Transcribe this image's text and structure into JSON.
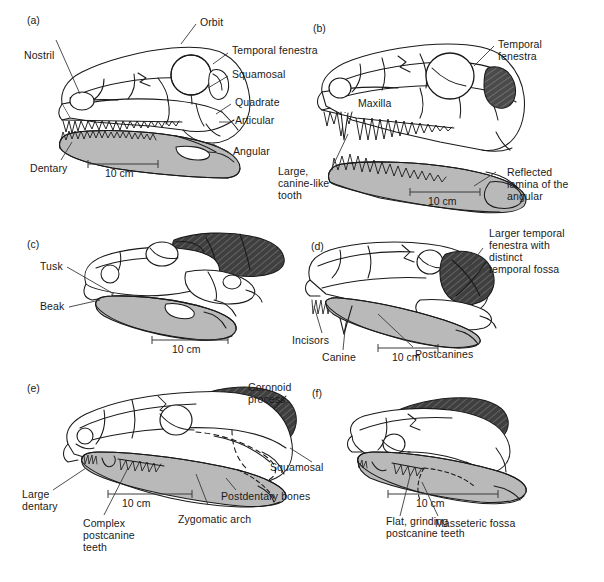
{
  "figure": {
    "type": "scientific-illustration",
    "panel_count": 6,
    "scale_bar_label": "10 cm",
    "colors": {
      "background": "#ffffff",
      "outline": "#1a1a1a",
      "dentary_fill": "#b9b9b9",
      "fenestra_dark_fill": "#4a4a4a",
      "bone_fill": "#ffffff",
      "leader_line": "#3a3a3a"
    }
  },
  "panels": [
    {
      "id": "(a)",
      "scale": "10 cm",
      "labels": [
        {
          "text": "Orbit"
        },
        {
          "text": "Nostril"
        },
        {
          "text": "Temporal fenestra"
        },
        {
          "text": "Squamosal"
        },
        {
          "text": "Quadrate"
        },
        {
          "text": "Articular"
        },
        {
          "text": "Angular"
        },
        {
          "text": "Dentary"
        }
      ]
    },
    {
      "id": "(b)",
      "scale": "10 cm",
      "labels": [
        {
          "text": "Temporal\nfenestra"
        },
        {
          "text": "Maxilla"
        },
        {
          "text": "Large,\ncanine-like\ntooth"
        },
        {
          "text": "Reflected\nlamina of the\nangular"
        }
      ]
    },
    {
      "id": "(c)",
      "scale": "10 cm",
      "labels": [
        {
          "text": "Tusk"
        },
        {
          "text": "Beak"
        }
      ]
    },
    {
      "id": "(d)",
      "scale": "10 cm",
      "labels": [
        {
          "text": "Larger temporal\nfenestra with\ndistinct\ntemporal fossa"
        },
        {
          "text": "Incisors"
        },
        {
          "text": "Canine"
        },
        {
          "text": "Postcanines"
        }
      ]
    },
    {
      "id": "(e)",
      "scale": "10 cm",
      "labels": [
        {
          "text": "Coronoid\nprocess"
        },
        {
          "text": "Squamosal"
        },
        {
          "text": "Postdentary bones"
        },
        {
          "text": "Zygomatic arch"
        },
        {
          "text": "Complex\npostcanine\nteeth"
        },
        {
          "text": "Large\ndentary"
        }
      ]
    },
    {
      "id": "(f)",
      "scale": "10 cm",
      "labels": [
        {
          "text": "Flat, grinding\npostcanine teeth"
        },
        {
          "text": "Masseteric fossa"
        }
      ]
    }
  ],
  "text": {
    "a_id": "(a)",
    "a_orbit": "Orbit",
    "a_nostril": "Nostril",
    "a_temporal_fenestra": "Temporal fenestra",
    "a_squamosal": "Squamosal",
    "a_quadrate": "Quadrate",
    "a_articular": "Articular",
    "a_angular": "Angular",
    "a_dentary": "Dentary",
    "a_scale": "10 cm",
    "b_id": "(b)",
    "b_temporal_fenestra_l1": "Temporal",
    "b_temporal_fenestra_l2": "fenestra",
    "b_maxilla": "Maxilla",
    "b_canine_l1": "Large,",
    "b_canine_l2": "canine-like",
    "b_canine_l3": "tooth",
    "b_reflected_l1": "Reflected",
    "b_reflected_l2": "lamina of the",
    "b_reflected_l3": "angular",
    "b_scale": "10 cm",
    "c_id": "(c)",
    "c_tusk": "Tusk",
    "c_beak": "Beak",
    "c_scale": "10 cm",
    "d_id": "(d)",
    "d_fenestra_l1": "Larger temporal",
    "d_fenestra_l2": "fenestra with",
    "d_fenestra_l3": "distinct",
    "d_fenestra_l4": "temporal fossa",
    "d_incisors": "Incisors",
    "d_canine": "Canine",
    "d_postcanines": "Postcanines",
    "d_scale": "10 cm",
    "e_id": "(e)",
    "e_coronoid_l1": "Coronoid",
    "e_coronoid_l2": "process",
    "e_squamosal": "Squamosal",
    "e_postdentary": "Postdentary bones",
    "e_zygomatic": "Zygomatic arch",
    "e_complex_l1": "Complex",
    "e_complex_l2": "postcanine",
    "e_complex_l3": "teeth",
    "e_large_l1": "Large",
    "e_large_l2": "dentary",
    "e_scale": "10 cm",
    "f_id": "(f)",
    "f_flat_l1": "Flat, grinding",
    "f_flat_l2": "postcanine teeth",
    "f_masseteric": "Masseteric fossa",
    "f_scale": "10 cm"
  }
}
